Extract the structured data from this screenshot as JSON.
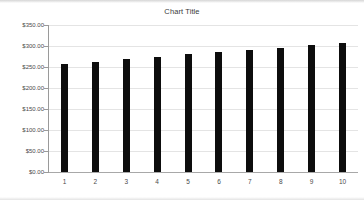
{
  "chart_data": {
    "type": "bar",
    "title": "Chart Title",
    "xlabel": "",
    "ylabel": "",
    "categories": [
      "1",
      "2",
      "3",
      "4",
      "5",
      "6",
      "7",
      "8",
      "9",
      "10"
    ],
    "values": [
      257,
      262,
      269,
      274,
      281,
      286,
      291,
      296,
      303,
      308
    ],
    "ylim": [
      0,
      350
    ],
    "y_ticks": [
      0,
      50,
      100,
      150,
      200,
      250,
      300,
      350
    ],
    "y_tick_labels": [
      "$0.00",
      "$50.00",
      "$100.00",
      "$150.00",
      "$200.00",
      "$250.00",
      "$300.00",
      "$350.00"
    ],
    "grid": true,
    "legend": false,
    "series_color": "#0d0d0d",
    "gridline_color": "#e4e4e4",
    "axis_color": "#9a9a9a"
  }
}
